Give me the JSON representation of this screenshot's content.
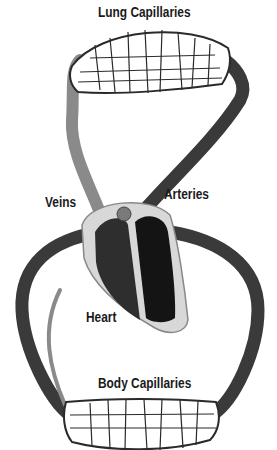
{
  "diagram": {
    "labels": {
      "lung_capillaries": "Lung Capillaries",
      "veins": "Veins",
      "arteries": "Arteries",
      "heart": "Heart",
      "body_capillaries": "Body Capillaries"
    },
    "colors": {
      "artery": "#3a3a3a",
      "vein": "#8a8a8a",
      "heart_chamber": "#1e1e1e",
      "heart_wall": "#d8d8d8",
      "capillary_bed": "#ffffff",
      "capillary_lines": "#2a2a2a"
    }
  }
}
